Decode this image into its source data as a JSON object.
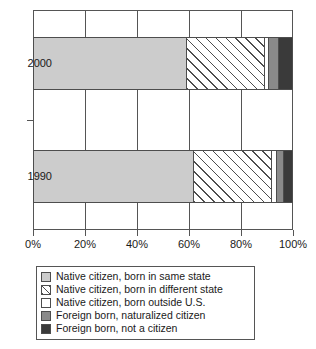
{
  "chart_data": {
    "type": "bar",
    "orientation": "horizontal",
    "stacked": true,
    "title": "",
    "xlabel": "",
    "ylabel": "",
    "categories": [
      "2000",
      "1990"
    ],
    "xlim": [
      0,
      100
    ],
    "xticks": [
      0,
      20,
      40,
      60,
      80,
      100
    ],
    "xticklabels": [
      "0%",
      "20%",
      "40%",
      "60%",
      "80%",
      "100%"
    ],
    "grid": true,
    "legend_position": "below",
    "series": [
      {
        "name": "Native citizen, born in same state",
        "color": "#cccccc",
        "pattern": "solid",
        "values": [
          58.8,
          61.5
        ]
      },
      {
        "name": "Native citizen, born in different state",
        "color": "#ffffff",
        "pattern": "diagonal-hatch",
        "values": [
          29.9,
          30.0
        ]
      },
      {
        "name": "Native citizen, born outside U.S.",
        "color": "#ffffff",
        "pattern": "solid",
        "values": [
          1.6,
          1.9
        ]
      },
      {
        "name": "Foreign born, naturalized citizen",
        "color": "#8a8a8a",
        "pattern": "solid",
        "values": [
          3.8,
          2.7
        ]
      },
      {
        "name": "Foreign born, not a citizen",
        "color": "#3a3a3a",
        "pattern": "solid",
        "values": [
          5.9,
          3.9
        ]
      }
    ]
  },
  "axis": {
    "y_labels": [
      {
        "text": "2000"
      },
      {
        "text": "1990"
      }
    ],
    "x_labels": [
      {
        "text": "0%",
        "pos": 0
      },
      {
        "text": "20%",
        "pos": 20
      },
      {
        "text": "40%",
        "pos": 40
      },
      {
        "text": "60%",
        "pos": 60
      },
      {
        "text": "80%",
        "pos": 80
      },
      {
        "text": "100%",
        "pos": 100
      }
    ]
  },
  "legend": {
    "items": [
      {
        "label": "Native citizen, born in same state",
        "swatch": "swatch-light-gray"
      },
      {
        "label": "Native citizen, born in different state",
        "swatch": "swatch-hatched"
      },
      {
        "label": "Native citizen, born outside U.S.",
        "swatch": "swatch-white"
      },
      {
        "label": "Foreign born, naturalized citizen",
        "swatch": "swatch-medium-gray"
      },
      {
        "label": "Foreign born, not a citizen",
        "swatch": "swatch-dark-gray"
      }
    ]
  }
}
